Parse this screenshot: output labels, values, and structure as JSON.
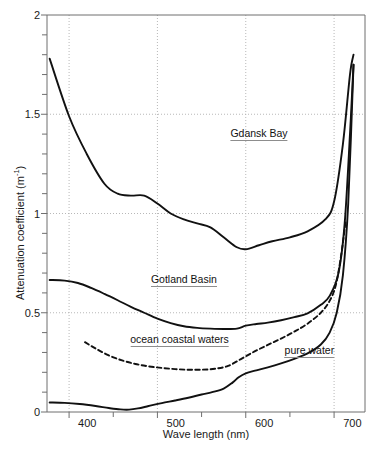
{
  "chart_data": {
    "type": "line",
    "title": "",
    "xlabel": "Wave length (nm)",
    "ylabel": "Attenuation coefficient (m⁻¹)",
    "xlim": [
      375,
      735
    ],
    "ylim": [
      0,
      2
    ],
    "xticks": [
      400,
      500,
      600,
      700
    ],
    "yticks": [
      0,
      0.5,
      1,
      1.5,
      2
    ],
    "ytick_labels": [
      "0",
      "0.5",
      "1",
      "1.5",
      "2"
    ],
    "xtick_labels": [
      "400",
      "500",
      "600",
      "700"
    ],
    "y_minor_tick_step": 0.1,
    "grid": "dotted gridlines at major x and y ticks",
    "legend_position": "inline labels on curves",
    "series": [
      {
        "name": "Gdansk Bay",
        "style": "solid",
        "label_x": 615,
        "label_y": 1.38,
        "x": [
          378,
          400,
          420,
          440,
          455,
          470,
          485,
          500,
          515,
          530,
          545,
          560,
          575,
          590,
          600,
          615,
          630,
          650,
          670,
          690,
          700,
          710,
          718,
          722
        ],
        "y": [
          1.78,
          1.49,
          1.3,
          1.15,
          1.1,
          1.09,
          1.09,
          1.05,
          1.0,
          0.97,
          0.95,
          0.93,
          0.88,
          0.83,
          0.82,
          0.84,
          0.86,
          0.88,
          0.91,
          0.97,
          1.06,
          1.35,
          1.7,
          1.8
        ]
      },
      {
        "name": "Gotland Basin",
        "style": "solid",
        "label_x": 530,
        "label_y": 0.645,
        "x": [
          378,
          395,
          410,
          425,
          440,
          455,
          470,
          485,
          500,
          515,
          530,
          545,
          560,
          575,
          590,
          600,
          612,
          625,
          640,
          655,
          670,
          685,
          695,
          705,
          712,
          718,
          722
        ],
        "y": [
          0.665,
          0.662,
          0.65,
          0.625,
          0.595,
          0.563,
          0.53,
          0.5,
          0.47,
          0.448,
          0.432,
          0.424,
          0.42,
          0.418,
          0.42,
          0.435,
          0.443,
          0.45,
          0.462,
          0.478,
          0.497,
          0.54,
          0.585,
          0.7,
          0.95,
          1.4,
          1.75
        ]
      },
      {
        "name": "ocean coastal waters",
        "style": "dashed",
        "label_x": 525,
        "label_y": 0.345,
        "x": [
          418,
          430,
          445,
          460,
          475,
          490,
          505,
          520,
          535,
          550,
          565,
          580,
          595,
          610,
          625,
          640,
          655,
          670,
          685,
          695,
          702,
          708,
          713
        ],
        "y": [
          0.352,
          0.32,
          0.285,
          0.26,
          0.242,
          0.23,
          0.222,
          0.216,
          0.213,
          0.213,
          0.218,
          0.232,
          0.268,
          0.305,
          0.338,
          0.37,
          0.405,
          0.445,
          0.5,
          0.56,
          0.64,
          0.79,
          0.96
        ]
      },
      {
        "name": "pure water",
        "style": "solid",
        "label_x": 672,
        "label_y": 0.285,
        "x": [
          378,
          395,
          412,
          430,
          445,
          458,
          468,
          478,
          490,
          505,
          520,
          535,
          550,
          562,
          575,
          585,
          592,
          600,
          612,
          625,
          640,
          655,
          670,
          685,
          695,
          703,
          710,
          716,
          722
        ],
        "y": [
          0.048,
          0.046,
          0.04,
          0.03,
          0.02,
          0.013,
          0.012,
          0.018,
          0.03,
          0.045,
          0.058,
          0.072,
          0.088,
          0.1,
          0.118,
          0.148,
          0.175,
          0.195,
          0.21,
          0.225,
          0.245,
          0.268,
          0.295,
          0.34,
          0.4,
          0.5,
          0.69,
          1.05,
          1.75
        ]
      }
    ]
  },
  "geometry": {
    "plot_left_px": 47,
    "plot_right_px": 365,
    "plot_top_px": 15,
    "plot_bottom_px": 412
  },
  "colors": {
    "curve": "#111111",
    "grid": "#b0b0b0",
    "axis": "#6f6f6f",
    "text": "#1a1a1a",
    "label_rule": "#8d8d8d",
    "background": "#ffffff"
  }
}
